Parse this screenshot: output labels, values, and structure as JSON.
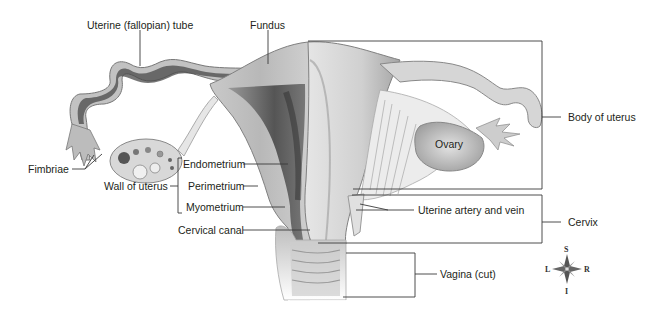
{
  "diagram": {
    "labels": {
      "uterine_tube": "Uterine (fallopian) tube",
      "fundus": "Fundus",
      "fimbriae": "Fimbriae",
      "wall_of_uterus": "Wall of uterus",
      "endometrium": "Endometrium",
      "perimetrium": "Perimetrium",
      "myometrium": "Myometrium",
      "cervical_canal": "Cervical canal",
      "ovary": "Ovary",
      "body_of_uterus": "Body of uterus",
      "uterine_artery_vein": "Uterine artery and vein",
      "cervix": "Cervix",
      "vagina": "Vagina (cut)"
    },
    "compass": {
      "superior": "S",
      "inferior": "I",
      "left": "L",
      "right": "R"
    },
    "colors": {
      "background": "#ffffff",
      "tissue_light": "#d4d4d4",
      "tissue_mid": "#a9a9a9",
      "tissue_dark": "#5e5e5e",
      "leader_line": "#3a3a3a",
      "text": "#231f20"
    }
  }
}
